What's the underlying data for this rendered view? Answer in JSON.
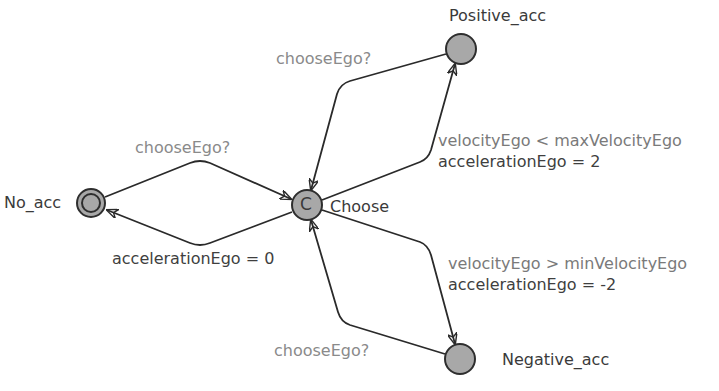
{
  "colors": {
    "edge": "#2a2a2a",
    "node_fill": "#a8a8a8",
    "node_stroke": "#2e2e2e",
    "location_label": "#3a3a3a",
    "sync_label": "#8a8a8a",
    "guard_label": "#7a7a7a",
    "update_label": "#3f3f3f"
  },
  "locations": {
    "no_acc": {
      "name": "No_acc",
      "type": "initial"
    },
    "choose": {
      "name": "Choose",
      "type": "committed",
      "marker": "C"
    },
    "positive_acc": {
      "name": "Positive_acc",
      "type": "normal"
    },
    "negative_acc": {
      "name": "Negative_acc",
      "type": "normal"
    }
  },
  "edges": {
    "no_acc_to_choose": {
      "sync": "chooseEgo?"
    },
    "choose_to_no_acc": {
      "update": "accelerationEgo = 0"
    },
    "positive_to_choose": {
      "sync": "chooseEgo?"
    },
    "choose_to_positive": {
      "guard": "velocityEgo < maxVelocityEgo",
      "update": "accelerationEgo = 2"
    },
    "choose_to_negative": {
      "guard": "velocityEgo > minVelocityEgo",
      "update": "accelerationEgo = -2"
    },
    "negative_to_choose": {
      "sync": "chooseEgo?"
    }
  }
}
